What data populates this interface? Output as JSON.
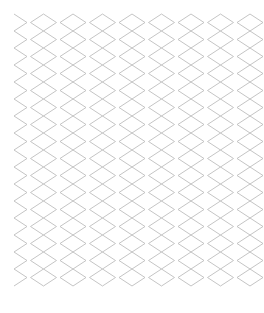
{
  "pattern": {
    "kind": "zigzag-lattice",
    "stroke_color": "#bdbdbd",
    "background": "#ffffff",
    "bounds": {
      "x0": 14,
      "y0": 14,
      "x1": 250,
      "y1": 293
    },
    "columns": 8,
    "column_pitch": 29.5,
    "amplitude": 13,
    "period": 17
  }
}
